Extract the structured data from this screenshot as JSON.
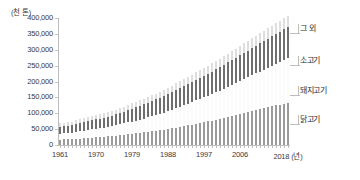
{
  "chart_data": {
    "type": "bar",
    "stacked": true,
    "title": "",
    "subtitle": "",
    "unit_label": "(천 톤)",
    "xlabel": "(년)",
    "ylabel": "",
    "ylim": [
      0,
      400000
    ],
    "ytick_values": [
      0,
      50000,
      100000,
      150000,
      200000,
      250000,
      300000,
      350000,
      400000
    ],
    "ytick_labels": [
      "0",
      "50,000",
      "100,000",
      "150,000",
      "200,000",
      "250,000",
      "300,000",
      "350,000",
      "400,000"
    ],
    "grid": false,
    "legend_position": "right-callout",
    "x": [
      1961,
      1962,
      1963,
      1964,
      1965,
      1966,
      1967,
      1968,
      1969,
      1970,
      1971,
      1972,
      1973,
      1974,
      1975,
      1976,
      1977,
      1978,
      1979,
      1980,
      1981,
      1982,
      1983,
      1984,
      1985,
      1986,
      1987,
      1988,
      1989,
      1990,
      1991,
      1992,
      1993,
      1994,
      1995,
      1996,
      1997,
      1998,
      1999,
      2000,
      2001,
      2002,
      2003,
      2004,
      2005,
      2006,
      2007,
      2008,
      2009,
      2010,
      2011,
      2012,
      2013,
      2014,
      2015,
      2016,
      2017,
      2018
    ],
    "xtick_labels": [
      "1961",
      "1970",
      "1979",
      "1988",
      "1997",
      "2006",
      "2018"
    ],
    "xtick_years": [
      1961,
      1970,
      1979,
      1988,
      1997,
      2006,
      2018
    ],
    "xaxis_unit": "(년)",
    "series": [
      {
        "name": "닭고기",
        "color": "#9b9b9b",
        "values": [
          17000,
          17500,
          18000,
          18500,
          19500,
          20500,
          21500,
          22500,
          23500,
          24500,
          25500,
          26500,
          27500,
          28500,
          29500,
          31000,
          32500,
          34000,
          35500,
          37000,
          38500,
          40000,
          41500,
          43000,
          44500,
          46500,
          48500,
          50500,
          52500,
          54500,
          57000,
          59500,
          62000,
          64500,
          67000,
          69500,
          72000,
          74500,
          77000,
          80000,
          82500,
          85500,
          88500,
          91500,
          94500,
          97500,
          100500,
          103500,
          106500,
          109500,
          112500,
          115500,
          118500,
          121500,
          124500,
          127500,
          130500,
          133500
        ]
      },
      {
        "name": "돼지고기",
        "color": "#fbfbfb",
        "values": [
          19000,
          19500,
          20000,
          20500,
          21500,
          22500,
          23500,
          24500,
          25500,
          26500,
          27500,
          28500,
          29500,
          31000,
          32500,
          34000,
          35500,
          37000,
          38500,
          40000,
          41500,
          43500,
          45500,
          47500,
          49500,
          51500,
          53500,
          56000,
          58500,
          61000,
          63500,
          66000,
          68500,
          71000,
          73500,
          76000,
          78500,
          81000,
          83500,
          86500,
          89000,
          92000,
          95000,
          98000,
          101000,
          104000,
          107000,
          110000,
          113000,
          116000,
          119000,
          122000,
          125000,
          128000,
          131000,
          134000,
          137000,
          140000
        ]
      },
      {
        "name": "소고기",
        "color": "#6f6f6f",
        "values": [
          22000,
          22500,
          23000,
          23500,
          24500,
          25500,
          26500,
          27500,
          28500,
          29500,
          30500,
          31500,
          32500,
          33500,
          34500,
          36000,
          37500,
          39000,
          40500,
          42000,
          43500,
          45000,
          46500,
          48000,
          49500,
          51000,
          52500,
          54000,
          55500,
          57000,
          58500,
          60000,
          61500,
          63000,
          64500,
          66000,
          67500,
          69000,
          70500,
          72000,
          73500,
          75000,
          76500,
          78000,
          79500,
          81000,
          82500,
          84000,
          85500,
          87000,
          88500,
          90000,
          91500,
          93000,
          94500,
          96000,
          97500,
          99000
        ]
      },
      {
        "name": "그 외",
        "color": "#dedede",
        "values": [
          11000,
          11200,
          11400,
          11600,
          11900,
          12200,
          12500,
          12800,
          13100,
          13400,
          13700,
          14000,
          14300,
          14600,
          14900,
          15300,
          15700,
          16100,
          16500,
          16900,
          17300,
          17700,
          18100,
          18500,
          18900,
          19400,
          19900,
          20400,
          20900,
          21400,
          21900,
          22400,
          22900,
          23400,
          23900,
          24400,
          24900,
          25400,
          25900,
          26500,
          27000,
          27500,
          28000,
          28500,
          29000,
          29500,
          30000,
          30500,
          31000,
          31500,
          32000,
          32500,
          33000,
          33500,
          34000,
          34500,
          35000,
          35500
        ]
      }
    ],
    "legend_callouts": [
      {
        "name": "그 외",
        "top": 22
      },
      {
        "name": "소고기",
        "top": 54
      },
      {
        "name": "돼지고기",
        "top": 84
      },
      {
        "name": "닭고기",
        "top": 113
      }
    ]
  }
}
